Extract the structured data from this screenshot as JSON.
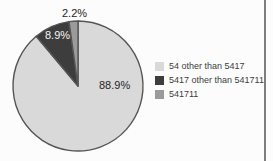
{
  "chart_data": {
    "type": "pie",
    "categories": [
      "54 other than 5417",
      "5417 other than 541711",
      "541711"
    ],
    "values": [
      88.9,
      8.9,
      2.2
    ],
    "slice_labels": [
      "88.9%",
      "8.9%",
      "2.2%"
    ],
    "colors": [
      "#d9d9d9",
      "#3d3d3d",
      "#9b9b9b"
    ],
    "outline_color": "#555555",
    "start_angle_deg": 0,
    "direction": "clockwise",
    "title": "",
    "legend_position": "right",
    "legend_entries": [
      {
        "label": "54 other than 5417"
      },
      {
        "label": "5417 other than 541711"
      },
      {
        "label": "541711"
      }
    ]
  }
}
